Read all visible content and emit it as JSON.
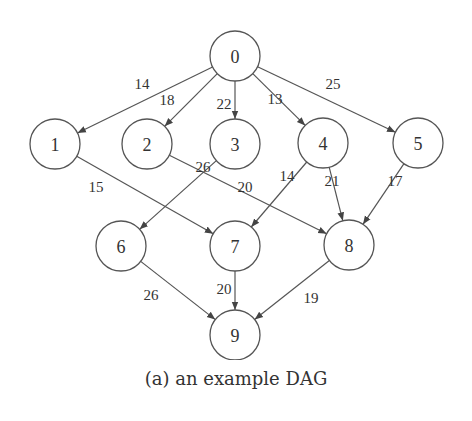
{
  "figure": {
    "caption": "(a) an example DAG",
    "node_radius": 25,
    "colors": {
      "stroke": "#555555",
      "text": "#333333",
      "background": "#ffffff"
    }
  },
  "nodes": [
    {
      "id": "0",
      "label": "0",
      "x": 235,
      "y": 56
    },
    {
      "id": "1",
      "label": "1",
      "x": 55,
      "y": 144
    },
    {
      "id": "2",
      "label": "2",
      "x": 147,
      "y": 144
    },
    {
      "id": "3",
      "label": "3",
      "x": 235,
      "y": 144
    },
    {
      "id": "4",
      "label": "4",
      "x": 323,
      "y": 143
    },
    {
      "id": "5",
      "label": "5",
      "x": 418,
      "y": 143
    },
    {
      "id": "6",
      "label": "6",
      "x": 121,
      "y": 246
    },
    {
      "id": "7",
      "label": "7",
      "x": 235,
      "y": 246
    },
    {
      "id": "8",
      "label": "8",
      "x": 349,
      "y": 245
    },
    {
      "id": "9",
      "label": "9",
      "x": 235,
      "y": 335
    }
  ],
  "edges": [
    {
      "from": "0",
      "to": "1",
      "weight": "14",
      "lx": 142,
      "ly": 84
    },
    {
      "from": "0",
      "to": "2",
      "weight": "18",
      "lx": 167,
      "ly": 100
    },
    {
      "from": "0",
      "to": "3",
      "weight": "22",
      "lx": 224,
      "ly": 104
    },
    {
      "from": "0",
      "to": "4",
      "weight": "13",
      "lx": 275,
      "ly": 99
    },
    {
      "from": "0",
      "to": "5",
      "weight": "25",
      "lx": 333,
      "ly": 84
    },
    {
      "from": "1",
      "to": "7",
      "weight": "15",
      "lx": 96,
      "ly": 187
    },
    {
      "from": "3",
      "to": "6",
      "weight": "26",
      "lx": 203,
      "ly": 167
    },
    {
      "from": "2",
      "to": "8",
      "weight": "20",
      "lx": 245,
      "ly": 187
    },
    {
      "from": "4",
      "to": "7",
      "weight": "14",
      "lx": 287,
      "ly": 176
    },
    {
      "from": "4",
      "to": "8",
      "weight": "21",
      "lx": 332,
      "ly": 181
    },
    {
      "from": "5",
      "to": "8",
      "weight": "17",
      "lx": 395,
      "ly": 181
    },
    {
      "from": "6",
      "to": "9",
      "weight": "26",
      "lx": 151,
      "ly": 295
    },
    {
      "from": "7",
      "to": "9",
      "weight": "20",
      "lx": 224,
      "ly": 289
    },
    {
      "from": "8",
      "to": "9",
      "weight": "19",
      "lx": 311,
      "ly": 298
    }
  ]
}
